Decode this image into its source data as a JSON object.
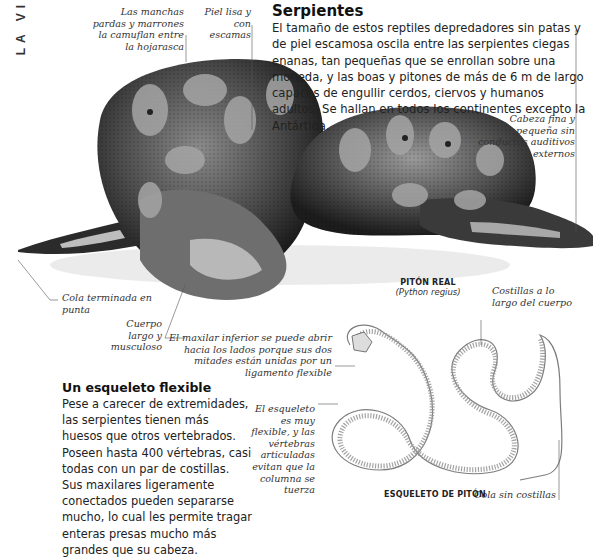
{
  "page": {
    "side_title": "LA VI"
  },
  "intro": {
    "title": "Serpientes",
    "body": "El tamaño de estos reptiles depredadores sin patas y de piel escamosa oscila entre las serpientes ciegas enanas, tan pequeñas que se enrollan sobre una moneda, y las boas y pitones de más de 6 m de largo capaces de engullir cerdos, ciervos y humanos adultos. Se hallan en todos los continentes excepto la Antártida."
  },
  "python_photo": {
    "name": "PITÓN REAL",
    "scientific_name": "(Python regius)",
    "captions": {
      "patches": "Las manchas pardas y marrones la camuflan entre la hojarasca",
      "skin": "Piel lisa y con escamas",
      "head": "Cabeza fina y pequeña sin conductos auditivos externos",
      "tail": "Cola terminada en punta",
      "body": "Cuerpo largo y musculoso"
    }
  },
  "skeleton_section": {
    "title": "Un esqueleto flexible",
    "body": "Pese a carecer de extremidades, las serpientes tienen más huesos que otros vertebrados. Poseen hasta 400 vértebras, casi todas con un par de costillas. Sus maxilares ligeramente conectados pueden separarse mucho, lo cual les permite tragar enteras presas mucho más grandes que su cabeza.",
    "skeleton_label": "ESQUELETO DE PITÓN",
    "captions": {
      "jaw": "El maxilar inferior se puede abrir hacia los lados porque sus dos mitades están unidas por un ligamento flexible",
      "ribs": "Costillas a lo largo del cuerpo",
      "flexible": "El esqueleto es muy flexible, y las vértebras articuladas evitan que la columna se tuerza",
      "tail": "Cola sin costillas"
    }
  }
}
